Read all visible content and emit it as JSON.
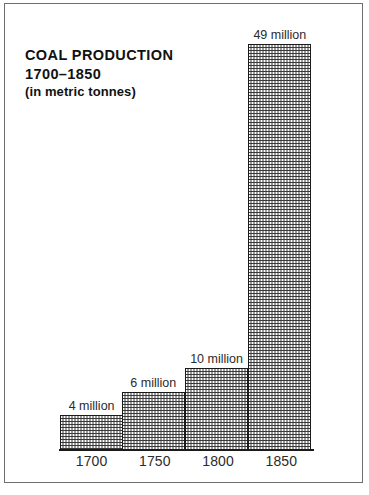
{
  "figure": {
    "title_lines": [
      "COAL PRODUCTION",
      "1700–1850",
      "(in metric tonnes)"
    ],
    "frame_color": "#6e6e6e",
    "bar_outline_color": "#1a1a1a",
    "background_color": "#ffffff"
  },
  "chart_data": {
    "type": "bar",
    "title": "COAL PRODUCTION 1700–1850 (in metric tonnes)",
    "subtitle": "(in metric tonnes)",
    "xlabel": "",
    "ylabel": "",
    "unit": "million metric tonnes",
    "categories": [
      "1700",
      "1750",
      "1800",
      "1850"
    ],
    "values": [
      4,
      6,
      10,
      49
    ],
    "data_labels": [
      "4 million",
      "6 million",
      "10 million",
      "49 million"
    ],
    "ylim": [
      0,
      49
    ],
    "grid": false,
    "legend": "none",
    "bar_fill": "halftone-checker",
    "bars": [
      {
        "category": "1700",
        "value": 4,
        "label": "4 million",
        "height_pct": 8.2
      },
      {
        "category": "1750",
        "value": 6,
        "label": "6 million",
        "height_pct": 13.5
      },
      {
        "category": "1800",
        "value": 10,
        "label": "10 million",
        "height_pct": 19.0
      },
      {
        "category": "1850",
        "value": 49,
        "label": "49 million",
        "height_pct": 94.5
      }
    ]
  }
}
